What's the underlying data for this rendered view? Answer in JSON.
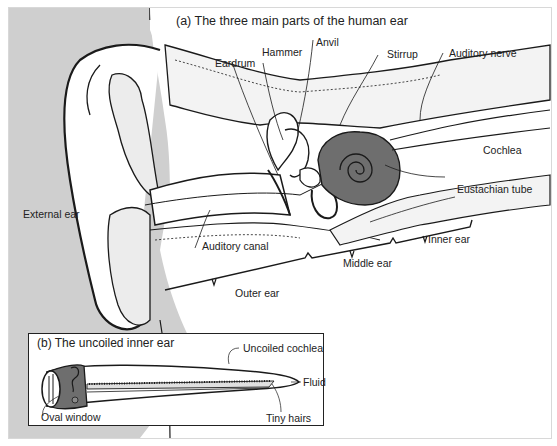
{
  "figure": {
    "panel_a": {
      "title": "(a)  The three main parts of the human ear",
      "labels": {
        "anvil": "Anvil",
        "hammer": "Hammer",
        "eardrum": "Eardrum",
        "stirrup": "Stirrup",
        "auditory_nerve": "Auditory nerve",
        "cochlea": "Cochlea",
        "eustachian_tube": "Eustachian tube",
        "external_ear": "External ear",
        "auditory_canal": "Auditory canal",
        "inner_ear": "Inner ear",
        "middle_ear": "Middle ear",
        "outer_ear": "Outer ear"
      }
    },
    "panel_b": {
      "title": "(b)  The uncoiled inner ear",
      "labels": {
        "uncoiled_cochlea": "Uncoiled cochlea",
        "fluid": "Fluid",
        "oval_window": "Oval window",
        "tiny_hairs": "Tiny hairs"
      }
    },
    "colors": {
      "head_shade": "#cfcfcf",
      "cochlea_fill": "#6e6e6e",
      "line": "#1a1a1a"
    }
  }
}
